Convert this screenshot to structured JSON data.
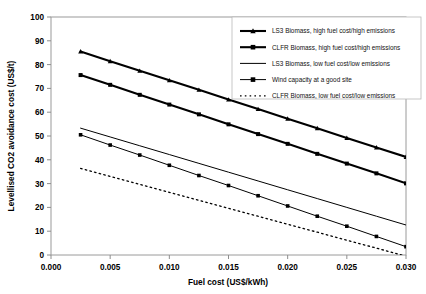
{
  "chart_data": {
    "type": "line",
    "title": "",
    "xlabel": "Fuel cost (US$/kWh)",
    "ylabel": "Levellised CO2 avoidance cost (US$/t)",
    "xlim": [
      0.0,
      0.03
    ],
    "ylim": [
      0,
      100
    ],
    "xticks": [
      0.0,
      0.005,
      0.01,
      0.015,
      0.02,
      0.025,
      0.03
    ],
    "xticklabels": [
      "0.000",
      "0.005",
      "0.010",
      "0.015",
      "0.020",
      "0.025",
      "0.030"
    ],
    "yticks": [
      0,
      10,
      20,
      30,
      40,
      50,
      60,
      70,
      80,
      90,
      100
    ],
    "yticklabels": [
      "0",
      "10",
      "20",
      "30",
      "40",
      "50",
      "60",
      "70",
      "80",
      "90",
      "100"
    ],
    "grid": false,
    "legend_position": "top-right",
    "x": [
      0.0025,
      0.005,
      0.0075,
      0.01,
      0.0125,
      0.015,
      0.0175,
      0.02,
      0.0225,
      0.025,
      0.0275,
      0.03
    ],
    "series": [
      {
        "name": "LS3 Biomass, high fuel cost/high emissions",
        "marker": "triangle",
        "style": "solid-thick",
        "values": [
          85.5,
          81.4,
          77.4,
          73.4,
          69.4,
          65.3,
          61.3,
          57.3,
          53.3,
          49.2,
          45.2,
          41.2
        ]
      },
      {
        "name": "CLFR Biomass, high fuel cost/high emissions",
        "marker": "square",
        "style": "solid-thick",
        "values": [
          75.6,
          71.5,
          67.3,
          63.2,
          59.1,
          54.9,
          50.8,
          46.7,
          42.5,
          38.4,
          34.3,
          30.1
        ]
      },
      {
        "name": "LS3 Biomass, low fuel cost/low emissions",
        "marker": "none",
        "style": "solid-thin",
        "values": [
          53.3,
          49.6,
          45.9,
          42.2,
          38.5,
          34.8,
          31.1,
          27.4,
          23.7,
          20.0,
          16.3,
          12.6
        ]
      },
      {
        "name": "Wind capacity at a good site",
        "marker": "square",
        "style": "solid-thin",
        "values": [
          50.5,
          46.2,
          42.0,
          37.7,
          33.4,
          29.2,
          24.9,
          20.6,
          16.3,
          12.1,
          7.8,
          3.5
        ]
      },
      {
        "name": "CLFR Biomass, low fuel cost/low emissions",
        "marker": "none",
        "style": "dotted",
        "values": [
          36.4,
          33.0,
          29.7,
          26.3,
          23.0,
          19.6,
          16.3,
          12.9,
          9.6,
          6.2,
          2.9,
          -0.5
        ]
      }
    ]
  }
}
